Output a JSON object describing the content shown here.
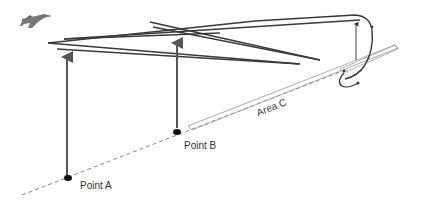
{
  "diagram": {
    "labels": {
      "point_a": "Point A",
      "point_b": "Point B",
      "area_c": "Area C"
    },
    "icons": {
      "aircraft": "fighter-jet-icon"
    },
    "colors": {
      "line": "#3a3a3a",
      "arrow": "#555555",
      "dashed": "#888888",
      "area_outline": "#999999",
      "point": "#111111"
    }
  }
}
